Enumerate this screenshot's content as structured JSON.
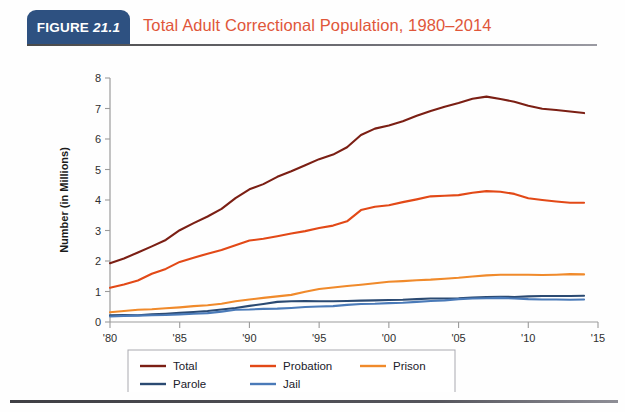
{
  "header": {
    "badge_word": "FIGURE",
    "badge_number": "21.1",
    "badge_color": "#2e5181",
    "title": "Total Adult Correctional Population, 1980–2014",
    "title_color": "#e0563a"
  },
  "chart_data": {
    "type": "line",
    "title": "Total Adult Correctional Population, 1980–2014",
    "xlabel": "",
    "ylabel": "Number (in Millions)",
    "xlim": [
      1980,
      2015
    ],
    "ylim": [
      0,
      8
    ],
    "grid": false,
    "legend_position": "bottom-center",
    "x_tick_labels": [
      "'80",
      "'85",
      "'90",
      "'95",
      "'00",
      "'05",
      "'10",
      "'15"
    ],
    "x_tick_values": [
      1980,
      1985,
      1990,
      1995,
      2000,
      2005,
      2010,
      2015
    ],
    "y_tick_labels": [
      "0",
      "1",
      "2",
      "3",
      "4",
      "5",
      "6",
      "7",
      "8"
    ],
    "y_tick_values": [
      0,
      1,
      2,
      3,
      4,
      5,
      6,
      7,
      8
    ],
    "x": [
      1980,
      1981,
      1982,
      1983,
      1984,
      1985,
      1986,
      1987,
      1988,
      1989,
      1990,
      1991,
      1992,
      1993,
      1994,
      1995,
      1996,
      1997,
      1998,
      1999,
      2000,
      2001,
      2002,
      2003,
      2004,
      2005,
      2006,
      2007,
      2008,
      2009,
      2010,
      2011,
      2012,
      2013,
      2014
    ],
    "series": [
      {
        "name": "Total",
        "color": "#7b1f14",
        "values": [
          1.93,
          2.08,
          2.28,
          2.48,
          2.69,
          3.01,
          3.24,
          3.46,
          3.71,
          4.06,
          4.35,
          4.52,
          4.76,
          4.94,
          5.14,
          5.34,
          5.49,
          5.73,
          6.13,
          6.34,
          6.44,
          6.58,
          6.76,
          6.92,
          7.06,
          7.18,
          7.32,
          7.39,
          7.31,
          7.22,
          7.09,
          6.99,
          6.95,
          6.9,
          6.85
        ]
      },
      {
        "name": "Probation",
        "color": "#e24917",
        "values": [
          1.12,
          1.23,
          1.36,
          1.58,
          1.74,
          1.97,
          2.11,
          2.24,
          2.36,
          2.52,
          2.67,
          2.73,
          2.81,
          2.9,
          2.98,
          3.08,
          3.16,
          3.3,
          3.67,
          3.78,
          3.83,
          3.93,
          4.02,
          4.12,
          4.14,
          4.16,
          4.24,
          4.29,
          4.27,
          4.2,
          4.06,
          4.0,
          3.95,
          3.91,
          3.91
        ]
      },
      {
        "name": "Prison",
        "color": "#f08a2b",
        "values": [
          0.32,
          0.36,
          0.4,
          0.42,
          0.45,
          0.48,
          0.52,
          0.55,
          0.6,
          0.68,
          0.74,
          0.79,
          0.84,
          0.89,
          0.99,
          1.08,
          1.13,
          1.18,
          1.22,
          1.27,
          1.32,
          1.34,
          1.37,
          1.39,
          1.42,
          1.45,
          1.49,
          1.53,
          1.55,
          1.55,
          1.55,
          1.54,
          1.55,
          1.57,
          1.56
        ]
      },
      {
        "name": "Parole",
        "color": "#2b4a72",
        "values": [
          0.22,
          0.23,
          0.22,
          0.25,
          0.27,
          0.3,
          0.33,
          0.36,
          0.41,
          0.46,
          0.53,
          0.59,
          0.66,
          0.68,
          0.69,
          0.68,
          0.68,
          0.69,
          0.7,
          0.71,
          0.72,
          0.73,
          0.75,
          0.77,
          0.77,
          0.78,
          0.8,
          0.82,
          0.83,
          0.82,
          0.84,
          0.85,
          0.85,
          0.85,
          0.86
        ]
      },
      {
        "name": "Jail",
        "color": "#4a7ab8",
        "values": [
          0.18,
          0.2,
          0.21,
          0.22,
          0.23,
          0.25,
          0.27,
          0.29,
          0.34,
          0.4,
          0.41,
          0.43,
          0.44,
          0.46,
          0.49,
          0.51,
          0.52,
          0.56,
          0.59,
          0.6,
          0.62,
          0.63,
          0.66,
          0.69,
          0.71,
          0.75,
          0.77,
          0.78,
          0.79,
          0.77,
          0.75,
          0.74,
          0.74,
          0.73,
          0.74
        ]
      }
    ]
  },
  "legend": {
    "items": [
      {
        "label": "Total",
        "color": "#7b1f14"
      },
      {
        "label": "Probation",
        "color": "#e24917"
      },
      {
        "label": "Prison",
        "color": "#f08a2b"
      },
      {
        "label": "Parole",
        "color": "#2b4a72"
      },
      {
        "label": "Jail",
        "color": "#4a7ab8"
      }
    ]
  }
}
